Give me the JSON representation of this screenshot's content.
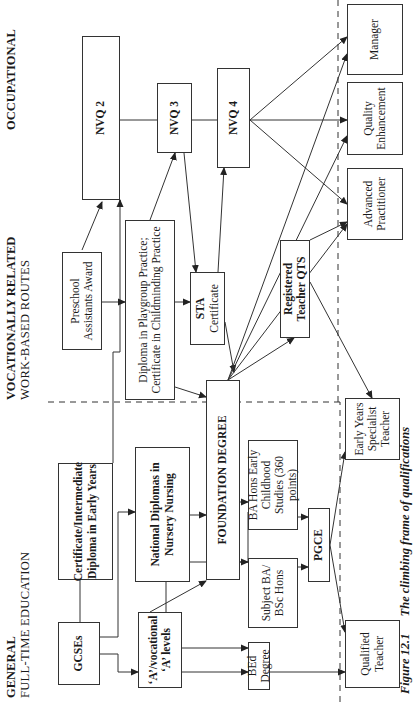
{
  "headers": {
    "general": {
      "line1": "GENERAL",
      "line2": "FULL-TIME EDUCATION"
    },
    "vocational": {
      "line1": "VOCATIONALLY RELATED",
      "line2": "WORK-BASED ROUTES"
    },
    "occupational": {
      "line1": "OCCUPATIONAL",
      "line2": ""
    }
  },
  "boxes": {
    "gcses": "GCSEs",
    "cert_intermediate": "Certificate/Intermediate Diploma in Early Years",
    "a_levels": "‘A’/vocational ‘A’ levels",
    "national_diplomas": "National Diplomas in Nursery Nursing",
    "foundation_degree": "FOUNDATION DEGREE",
    "bed_degree": "BEd Degree",
    "subject_ba": "Subject BA/ BSc Hons",
    "ba_hons": "BA Hons Early Childhood Studies (360 points)",
    "pgce": "PGCE",
    "qualified_teacher": "Qualified Teacher",
    "eys_teacher": "Early Years Specialist Teacher",
    "preschool": "Preschool Assistants Award",
    "diploma_playgroup": "Diploma in Playgroup Practice; Certificate in Childminding Practice",
    "sta_title": "STA",
    "sta_sub": "Certificate",
    "registered_teacher": "Registered Teacher QTS",
    "nvq2": "NVQ 2",
    "nvq3": "NVQ 3",
    "nvq4": "NVQ 4",
    "manager": "Manager",
    "quality_enhancement": "Quality Enhancement",
    "advanced_practitioner": "Advanced Practitioner"
  },
  "caption": {
    "number": "Figure 12.1",
    "title": "The climbing frame of qualifications"
  },
  "colors": {
    "line": "#333333",
    "background": "#ffffff",
    "text": "#1a1a1a"
  }
}
